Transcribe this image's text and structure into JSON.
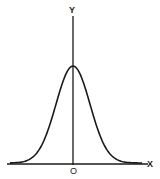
{
  "diagram": {
    "title": "",
    "type": "normal-distribution-curve",
    "axes": {
      "x_label": "X",
      "y_label": "Y",
      "origin_label": "O"
    },
    "curve": {
      "shape": "bell",
      "mean_at": "origin",
      "stroke_color": "#1a1a1a"
    }
  },
  "chart_data": {
    "type": "line",
    "title": "",
    "xlabel": "X",
    "ylabel": "Y",
    "x": [
      -3,
      -2.5,
      -2,
      -1.5,
      -1,
      -0.5,
      0,
      0.5,
      1,
      1.5,
      2,
      2.5,
      3
    ],
    "values": [
      0.004,
      0.018,
      0.054,
      0.13,
      0.242,
      0.352,
      0.399,
      0.352,
      0.242,
      0.13,
      0.054,
      0.018,
      0.004
    ],
    "annotations": [
      "O at origin"
    ],
    "grid": false
  }
}
